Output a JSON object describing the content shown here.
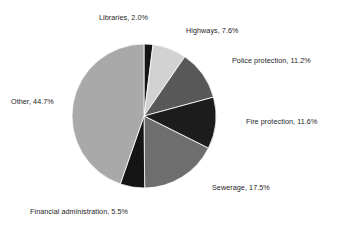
{
  "chart_data": {
    "type": "pie",
    "title": "",
    "subtitle": "",
    "xlabel": "",
    "ylabel": "",
    "grid": false,
    "legend_position": "none",
    "label_format": "{name}, {value}%",
    "start_angle_deg": 0,
    "direction": "clockwise",
    "geometry": {
      "center_x": 144,
      "center_y": 116,
      "radius": 72
    },
    "total_percent": 100.1,
    "categories": [
      "Libraries",
      "Highways",
      "Police protection",
      "Fire protection",
      "Sewerage",
      "Financial administration",
      "Other"
    ],
    "values": [
      2.0,
      7.6,
      11.2,
      11.6,
      17.5,
      5.5,
      44.7
    ],
    "slices": [
      {
        "name": "Libraries",
        "value": 2.0,
        "value_text": "2.0%",
        "label": "Libraries, 2.0%",
        "color": "#141414"
      },
      {
        "name": "Highways",
        "value": 7.6,
        "value_text": "7.6%",
        "label": "Highways, 7.6%",
        "color": "#d2d2d2"
      },
      {
        "name": "Police protection",
        "value": 11.2,
        "value_text": "11.2%",
        "label": "Police protection, 11.2%",
        "color": "#585858"
      },
      {
        "name": "Fire protection",
        "value": 11.6,
        "value_text": "11.6%",
        "label": "Fire protection, 11.6%",
        "color": "#1c1c1c"
      },
      {
        "name": "Sewerage",
        "value": 17.5,
        "value_text": "17.5%",
        "label": "Sewerage, 17.5%",
        "color": "#6e6e6e"
      },
      {
        "name": "Financial administration",
        "value": 5.5,
        "value_text": "5.5%",
        "label": "Financial administration, 5.5%",
        "color": "#151515"
      },
      {
        "name": "Other",
        "value": 44.7,
        "value_text": "44.7%",
        "label": "Other, 44.7%",
        "color": "#a9a9a9"
      }
    ]
  },
  "colors": {
    "background": "#ffffff",
    "label_text": "#1c1c1c",
    "slice_outline": "#ffffff"
  }
}
